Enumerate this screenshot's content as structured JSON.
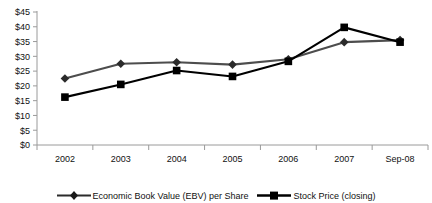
{
  "chart_data": {
    "type": "line",
    "title": "",
    "xlabel": "",
    "ylabel": "",
    "categories": [
      "2002",
      "2003",
      "2004",
      "2005",
      "2006",
      "2007",
      "Sep-08"
    ],
    "ylim": [
      0,
      45
    ],
    "ytick_step": 5,
    "ytick_labels": [
      "$0",
      "$5",
      "$10",
      "$15",
      "$20",
      "$25",
      "$30",
      "$35",
      "$40",
      "$45"
    ],
    "ytick_values": [
      0,
      5,
      10,
      15,
      20,
      25,
      30,
      35,
      40,
      45
    ],
    "grid": false,
    "legend_position": "bottom",
    "series": [
      {
        "name": "Economic Book Value (EBV) per Share",
        "marker": "diamond",
        "color": "#4d4d4d",
        "values": [
          22.5,
          27.5,
          28.0,
          27.2,
          29.0,
          34.8,
          35.5
        ]
      },
      {
        "name": "Stock Price (closing)",
        "marker": "square",
        "color": "#000000",
        "values": [
          16.2,
          20.5,
          25.2,
          23.2,
          28.3,
          39.8,
          34.8
        ]
      }
    ]
  },
  "legend": {
    "entries": [
      {
        "label": "Economic Book Value (EBV) per Share",
        "marker": "diamond-marker-icon"
      },
      {
        "label": "Stock Price (closing)",
        "marker": "square-marker-icon"
      }
    ]
  },
  "axes": {
    "y_axis_name": "dollar-value-axis",
    "x_axis_name": "period-axis"
  }
}
